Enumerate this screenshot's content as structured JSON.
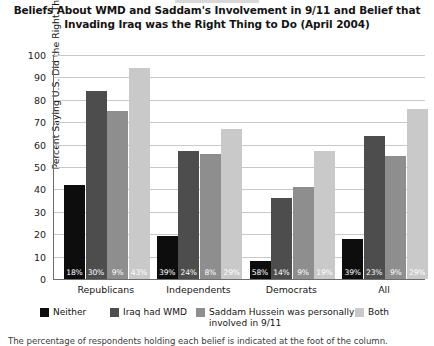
{
  "chart_data": {
    "type": "bar",
    "title": "Beliefs About WMD and Saddam's Involvement in 9/11 and Belief that Invading Iraq was the Right Thing to Do (April 2004)",
    "title_lines": [
      "Beliefs About WMD and Saddam's Involvement in 9/11 and Belief that",
      "Invading Iraq was the Right Thing to Do (April 2004)"
    ],
    "xlabel": "",
    "ylabel": "Percent Saying U.S. Did the Right Thing",
    "ylim": [
      0,
      100
    ],
    "ytick_step": 10,
    "yticks": [
      0,
      10,
      20,
      30,
      40,
      50,
      60,
      70,
      80,
      90,
      100
    ],
    "grid": true,
    "legend_position": "bottom",
    "categories": [
      "Republicans",
      "Independents",
      "Democrats",
      "All"
    ],
    "series": [
      {
        "name": "Neither",
        "color": "#0d0d0d",
        "values": [
          42,
          19,
          8,
          18
        ],
        "point_labels": [
          "18%",
          "39%",
          "58%",
          "39%"
        ]
      },
      {
        "name": "Iraq had WMD",
        "color": "#4d4d4d",
        "values": [
          84,
          57,
          36,
          64
        ],
        "point_labels": [
          "30%",
          "24%",
          "14%",
          "23%"
        ]
      },
      {
        "name": "Saddam Hussein was personally involved in 9/11",
        "color": "#8e8e8e",
        "values": [
          75,
          56,
          41,
          55
        ],
        "point_labels": [
          "9%",
          "8%",
          "9%",
          "9%"
        ]
      },
      {
        "name": "Both",
        "color": "#c9c9c9",
        "values": [
          94,
          67,
          57,
          76
        ],
        "point_labels": [
          "43%",
          "29%",
          "19%",
          "29%"
        ]
      }
    ],
    "annotations": {
      "footnote": "The percentage of respondents holding each belief is indicated at the foot of the column."
    }
  },
  "legend": {
    "items": [
      {
        "label": "Neither",
        "color": "#0d0d0d"
      },
      {
        "label": "Iraq had WMD",
        "color": "#4d4d4d"
      },
      {
        "label": "Saddam Hussein was personally\ninvolved in 9/11",
        "color": "#8e8e8e"
      },
      {
        "label": "Both",
        "color": "#c9c9c9"
      }
    ]
  }
}
